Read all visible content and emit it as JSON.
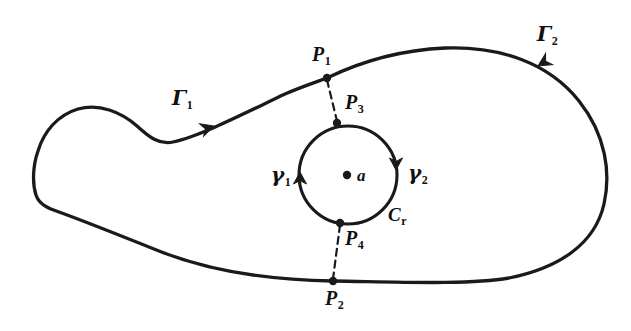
{
  "figure": {
    "kind": "complex-analysis-contour-diagram",
    "caption": "",
    "width": 631,
    "height": 331,
    "background_color": "#ffffff",
    "stroke_color": "#1a1a1a"
  },
  "labels": {
    "gamma_upper": {
      "base": "Γ",
      "sub": "1",
      "x": 172,
      "y": 88
    },
    "gamma_lower": {
      "base": "Γ",
      "sub": "2",
      "x": 537,
      "y": 24
    },
    "point_p1": {
      "base": "P",
      "sub": "1",
      "x": 312,
      "y": 44
    },
    "point_p2": {
      "base": "P",
      "sub": "2",
      "x": 325,
      "y": 288
    },
    "point_p3": {
      "base": "P",
      "sub": "3",
      "x": 345,
      "y": 92
    },
    "point_p4": {
      "base": "P",
      "sub": "4",
      "x": 345,
      "y": 228
    },
    "gamma_left": {
      "base": "γ",
      "sub": "1",
      "x": 271,
      "y": 165
    },
    "gamma_right": {
      "base": "γ",
      "sub": "2",
      "x": 408,
      "y": 163
    },
    "circle_cr": {
      "base": "C",
      "sub": "r",
      "x": 388,
      "y": 205
    },
    "center_a": {
      "base": "a",
      "sub": "",
      "x": 357,
      "y": 167
    }
  },
  "markers": {
    "center_point": {
      "name": "a",
      "x": 347,
      "y": 175,
      "radius": 4.2
    },
    "p1": {
      "x": 327,
      "y": 78,
      "radius": 4.2
    },
    "p2": {
      "x": 333,
      "y": 281,
      "radius": 4.2
    },
    "p3": {
      "x": 337,
      "y": 123,
      "radius": 4.2
    },
    "p4": {
      "x": 340,
      "y": 223,
      "radius": 4.2
    }
  },
  "inner_circle": {
    "name": "C_r",
    "center_x": 348,
    "center_y": 175,
    "radius": 49
  },
  "arrows": [
    {
      "name": "gamma1-arrow",
      "x": 300,
      "y": 168,
      "angle": 100
    },
    {
      "name": "gamma2-arrow",
      "x": 396,
      "y": 176,
      "angle": 280
    },
    {
      "name": "Gamma1-arrow",
      "x": 220,
      "y": 124,
      "angle": 196
    },
    {
      "name": "Gamma2-arrow",
      "x": 541,
      "y": 68,
      "angle": 299
    }
  ],
  "outer_contour_path": "M 327 78 C 360 62 400 50 445 48 C 500 46 548 62 578 100 C 606 134 610 172 604 203 C 596 243 560 268 510 278 C 470 285 400 282 333 281 C 270 280 210 272 160 252 C 120 236 85 222 60 213 C 48 209 40 205 37 196 C 33 184 34 166 38 152 C 44 132 58 116 78 110 C 98 104 120 112 136 126 C 148 137 158 144 172 141 C 200 135 248 110 284 94 C 300 87 315 82 327 78 Z",
  "dashed_segments": [
    {
      "name": "p1-p3-dash",
      "x1": 327,
      "y1": 78,
      "x2": 337,
      "y2": 123
    },
    {
      "name": "p4-p2-dash",
      "x1": 340,
      "y1": 223,
      "x2": 333,
      "y2": 281
    }
  ]
}
